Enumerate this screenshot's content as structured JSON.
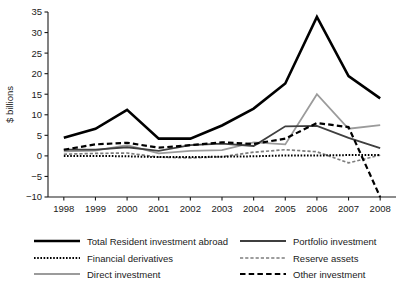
{
  "chart_data": {
    "type": "line",
    "title": "",
    "xlabel": "",
    "ylabel": "$ billions",
    "x": [
      1998,
      1999,
      2000,
      2001,
      2002,
      2003,
      2004,
      2005,
      2006,
      2007,
      2008
    ],
    "xtick_labels": [
      "1998",
      "1999",
      "2000",
      "2001",
      "2002",
      "2003",
      "2004",
      "2005",
      "2006",
      "2007",
      "2008"
    ],
    "ytick_labels": [
      "35",
      "30",
      "25",
      "20",
      "15",
      "10",
      "5",
      "0",
      "-5",
      "-10"
    ],
    "yticks": [
      35,
      30,
      25,
      20,
      15,
      10,
      5,
      0,
      -5,
      -10
    ],
    "ylim": [
      -10,
      35
    ],
    "xlim": [
      1997.5,
      2008.5
    ],
    "grid": false,
    "legend_position": "bottom",
    "series": [
      {
        "name": "Total Resident investment abroad",
        "style": "solid",
        "color": "#000000",
        "width": 2.6,
        "dash": "",
        "values": [
          4.4,
          6.6,
          11.2,
          4.2,
          4.2,
          7.4,
          11.5,
          17.6,
          33.8,
          19.4,
          14.0
        ]
      },
      {
        "name": "Portfolio investment",
        "style": "solid",
        "color": "#3f3f3f",
        "width": 1.8,
        "dash": "",
        "values": [
          1.5,
          1.5,
          2.1,
          1.2,
          2.6,
          3.0,
          2.4,
          7.2,
          7.3,
          4.4,
          1.9
        ]
      },
      {
        "name": "Financial derivatives",
        "style": "dotted",
        "color": "#000000",
        "width": 2.0,
        "dash": "1.6,1.6",
        "values": [
          0.0,
          0.0,
          -0.1,
          -0.3,
          -0.3,
          -0.2,
          -0.1,
          0.1,
          0.1,
          0.2,
          0.2
        ]
      },
      {
        "name": "Reserve assets",
        "style": "short-dash",
        "color": "#7d7d7d",
        "width": 1.7,
        "dash": "3.2,2.0",
        "values": [
          0.4,
          0.6,
          0.7,
          -0.3,
          -0.5,
          -0.2,
          0.9,
          1.5,
          1.0,
          -1.7,
          0.2
        ]
      },
      {
        "name": "Direct investment",
        "style": "solid",
        "color": "#9b9b9b",
        "width": 1.8,
        "dash": "",
        "values": [
          1.1,
          1.3,
          2.6,
          0.6,
          1.2,
          1.4,
          3.3,
          2.8,
          15.0,
          6.6,
          7.5
        ]
      },
      {
        "name": "Other investment",
        "style": "long-dash",
        "color": "#000000",
        "width": 2.2,
        "dash": "5.5,3.2",
        "values": [
          1.5,
          2.8,
          3.2,
          2.0,
          2.6,
          3.3,
          2.9,
          4.2,
          8.0,
          7.0,
          -10.0
        ]
      }
    ],
    "legend": [
      {
        "label": "Total Resident investment abroad",
        "series": 0,
        "column": "left",
        "row": 0
      },
      {
        "label": "Portfolio investment",
        "series": 1,
        "column": "right",
        "row": 0
      },
      {
        "label": "Financial derivatives",
        "series": 2,
        "column": "left",
        "row": 1
      },
      {
        "label": "Reserve assets",
        "series": 3,
        "column": "right",
        "row": 1
      },
      {
        "label": "Direct investment",
        "series": 4,
        "column": "left",
        "row": 2
      },
      {
        "label": "Other investment",
        "series": 5,
        "column": "right",
        "row": 2
      }
    ]
  }
}
